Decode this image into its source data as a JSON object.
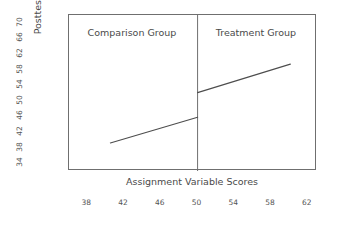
{
  "chart_data": {
    "type": "line",
    "title": "",
    "subtitle": "",
    "xlabel": "Assignment Variable Scores",
    "ylabel": "Posttest Scores",
    "xlim": [
      36,
      63
    ],
    "ylim": [
      32,
      72
    ],
    "xticks": [
      38,
      42,
      46,
      50,
      54,
      58,
      62
    ],
    "yticks": [
      34,
      38,
      42,
      46,
      50,
      54,
      58,
      62,
      66,
      70
    ],
    "grid": false,
    "legend": false,
    "legend_position": "none",
    "cutoff": 50,
    "discontinuity_jump": 6.3,
    "annotations": [
      {
        "text": "Comparison Group",
        "x": 44,
        "y": 69,
        "panel": "left"
      },
      {
        "text": "Treatment Group",
        "x": 56,
        "y": 69,
        "panel": "right"
      }
    ],
    "series": [
      {
        "name": "Comparison Group",
        "x": [
          40.5,
          50.0
        ],
        "values": [
          39.2,
          45.8
        ],
        "color": "#4d4d4d"
      },
      {
        "name": "Treatment Group",
        "x": [
          50.0,
          60.1
        ],
        "values": [
          52.1,
          59.4
        ],
        "color": "#4d4d4d"
      }
    ],
    "cutoff_line": {
      "x": 50,
      "y_from": 32,
      "y_to": 72,
      "color": "#6f6f6f"
    }
  },
  "axes": {
    "y_title": "Posttest Scores",
    "x_title": "Assignment Variable Scores",
    "y_tick_labels": [
      "70",
      "66",
      "62",
      "58",
      "54",
      "50",
      "46",
      "42",
      "38",
      "34"
    ],
    "x_tick_labels": [
      "38",
      "42",
      "46",
      "50",
      "54",
      "58",
      "62"
    ]
  },
  "panels": {
    "left_label": "Comparison Group",
    "right_label": "Treatment Group"
  },
  "colors": {
    "background": "#ffffff",
    "frame": "#6f6f6f",
    "line": "#4d4d4d",
    "text": "#4a4a4a",
    "tick_text": "#555555"
  }
}
